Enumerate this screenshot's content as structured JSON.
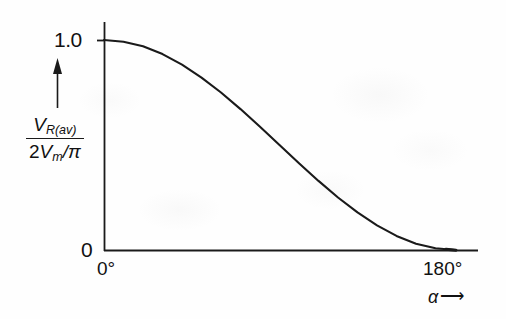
{
  "figure": {
    "background_color": "#fefefe",
    "ink_color": "#1a1a1a",
    "y_axis_arrow_icon": "up-arrow-icon",
    "x_axis_arrow_icon": "right-arrow-icon"
  },
  "axis_titles": {
    "y_numerator_v": "V",
    "y_numerator_sub": "R(av)",
    "y_denominator_lead": "2",
    "y_denominator_v": "V",
    "y_denominator_sub": "m",
    "y_denominator_tail": "/π",
    "x_symbol": "α",
    "x_arrow": "⟶"
  },
  "ticks": {
    "y_top": "1.0",
    "y_bottom": "0",
    "x_left": "0°",
    "x_right": "180°"
  },
  "chart_data": {
    "type": "line",
    "title": "",
    "subtitle": "",
    "xlabel": "α",
    "ylabel": "V_R(av) / (2V_m/π)",
    "xlim": [
      0,
      180
    ],
    "ylim": [
      0,
      1.0
    ],
    "x_unit": "degrees",
    "xticks": [
      0,
      180
    ],
    "xticklabels": [
      "0°",
      "180°"
    ],
    "yticks": [
      0,
      1.0
    ],
    "yticklabels": [
      "0",
      "1.0"
    ],
    "grid": false,
    "legend": null,
    "annotations": [],
    "series": [
      {
        "name": "(1 + cos α) / 2",
        "formula": "y = (1 + cos(alpha)) / 2",
        "x": [
          0,
          10,
          20,
          30,
          40,
          50,
          60,
          70,
          80,
          90,
          100,
          110,
          120,
          130,
          140,
          150,
          160,
          170,
          180
        ],
        "y": [
          1.0,
          0.992,
          0.97,
          0.933,
          0.883,
          0.821,
          0.75,
          0.671,
          0.587,
          0.5,
          0.413,
          0.329,
          0.25,
          0.179,
          0.117,
          0.067,
          0.03,
          0.008,
          0.0
        ]
      }
    ]
  }
}
